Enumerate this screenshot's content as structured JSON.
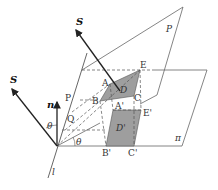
{
  "diagram": {
    "planes": {
      "P": "P",
      "pi": "π"
    },
    "vectors": {
      "S_upper": "S",
      "S_left": "S",
      "n": "n"
    },
    "line": "l",
    "angles": {
      "theta_left": "θ",
      "theta_bottom": "θ"
    },
    "points": {
      "A": "A",
      "B": "B",
      "C": "C",
      "D": "D",
      "E": "E",
      "P": "P",
      "Q": "Q",
      "A_prime": "A'",
      "B_prime": "B'",
      "C_prime": "C'",
      "D_prime": "D'",
      "E_prime": "E'"
    },
    "colors": {
      "shade": "#9e9e9e",
      "line": "#555555",
      "arrow": "#222222"
    }
  }
}
